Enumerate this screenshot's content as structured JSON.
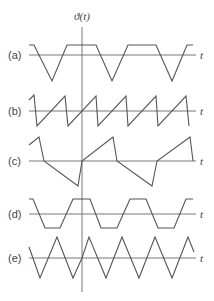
{
  "figure": {
    "y_axis_label": "ϑ(t)",
    "x_axis_label": "t",
    "colors": {
      "axis": "#777777",
      "wave": "#555555",
      "text": "#444444"
    },
    "panels": [
      {
        "id": "a",
        "label": "(a)",
        "shape": "trapezoid with V-shaped dips",
        "baseline_y": 55,
        "points": "29,45 34,45 52,81 67,45 96,45 112,81 128,45 156,45 172,81 187,45 193,45"
      },
      {
        "id": "b",
        "label": "(b)",
        "shape": "sawtooth (rising ramp, sharp drop)",
        "baseline_y": 111,
        "points": "29,100 34,95 37,126 65,96 68,126 96,96 98,126 126,96 128,126 156,96 158,126 186,96 189,126"
      },
      {
        "id": "c",
        "label": "(c)",
        "shape": "irregular asymmetric sawtooth",
        "baseline_y": 161,
        "points": "29,145 39,137 44,161 78,186 82,161 113,137 117,161 152,186 157,161 190,137 193,161"
      },
      {
        "id": "d",
        "label": "(d)",
        "shape": "trapezoidal wave",
        "baseline_y": 214,
        "points": "29,199 33,199 45,228 60,228 73,199 90,199 101,228 117,228 130,199 146,199 158,228 174,228 186,199 193,199"
      },
      {
        "id": "e",
        "label": "(e)",
        "shape": "triangular wave",
        "baseline_y": 258,
        "points": "29,247 40,278 57,237 73,278 82,258 89,237 106,278 122,237 139,278 155,237 172,278 188,237 194,252"
      }
    ]
  }
}
